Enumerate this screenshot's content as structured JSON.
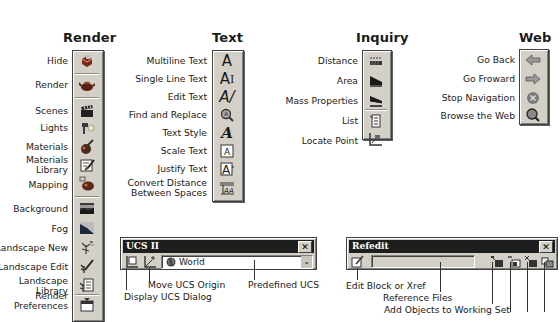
{
  "render": {
    "title": "Render",
    "items": [
      {
        "label": "Hide",
        "icon": "hide-icon"
      },
      {
        "label": "Render",
        "icon": "render-teapot-icon"
      },
      {
        "label": "Scenes",
        "icon": "scenes-clapboard-icon"
      },
      {
        "label": "Lights",
        "icon": "lights-icon"
      },
      {
        "label": "Materials",
        "icon": "materials-icon"
      },
      {
        "label": "Materials Library",
        "line1": "Materials",
        "line2": "Library",
        "icon": "materials-library-icon"
      },
      {
        "label": "Mapping",
        "icon": "mapping-icon"
      },
      {
        "label": "Background",
        "icon": "background-icon"
      },
      {
        "label": "Fog",
        "icon": "fog-icon"
      },
      {
        "label": "Landscape New",
        "icon": "landscape-new-icon"
      },
      {
        "label": "Landscape Edit",
        "icon": "landscape-edit-icon"
      },
      {
        "label": "Landscape Library",
        "line1": "Landscape",
        "line2": "Library",
        "icon": "landscape-library-icon"
      },
      {
        "label": "Render Preferences",
        "line1": "Render",
        "line2": "Preferences",
        "icon": "render-preferences-icon"
      }
    ]
  },
  "text": {
    "title": "Text",
    "items": [
      {
        "label": "Multiline Text",
        "icon": "multiline-text-icon"
      },
      {
        "label": "Single Line Text",
        "icon": "single-line-text-icon"
      },
      {
        "label": "Edit Text",
        "icon": "edit-text-icon"
      },
      {
        "label": "Find and Replace",
        "icon": "find-replace-icon"
      },
      {
        "label": "Text Style",
        "icon": "text-style-icon"
      },
      {
        "label": "Scale Text",
        "icon": "scale-text-icon"
      },
      {
        "label": "Justify Text",
        "icon": "justify-text-icon"
      },
      {
        "label": "Convert Distance Between Spaces",
        "line1": "Convert Distance",
        "line2": "Between Spaces",
        "icon": "convert-distance-icon"
      }
    ]
  },
  "inquiry": {
    "title": "Inquiry",
    "items": [
      {
        "label": "Distance",
        "icon": "distance-icon"
      },
      {
        "label": "Area",
        "icon": "area-icon"
      },
      {
        "label": "Mass Properties",
        "icon": "mass-properties-icon"
      },
      {
        "label": "List",
        "icon": "list-icon"
      },
      {
        "label": "Locate Point",
        "icon": "locate-point-icon"
      }
    ]
  },
  "web": {
    "title": "Web",
    "items": [
      {
        "label": "Go Back",
        "icon": "arrow-left-icon"
      },
      {
        "label": "Go Froward",
        "icon": "arrow-right-icon"
      },
      {
        "label": "Stop Navigation",
        "icon": "stop-icon"
      },
      {
        "label": "Browse the Web",
        "icon": "browse-web-icon"
      }
    ]
  },
  "ucs2": {
    "title": "UCS II",
    "close": "✕",
    "dropdown_value": "World",
    "callouts": {
      "move_origin": "Move UCS Origin",
      "display_dialog": "Display UCS Dialog",
      "predefined": "Predefined UCS"
    }
  },
  "refedit": {
    "title": "Refedit",
    "close": "✕",
    "reference_value": "",
    "callouts": {
      "edit_block": "Edit Block or Xref",
      "reference_files": "Reference Files",
      "add_objects": "Add Objects to Working Set"
    }
  }
}
